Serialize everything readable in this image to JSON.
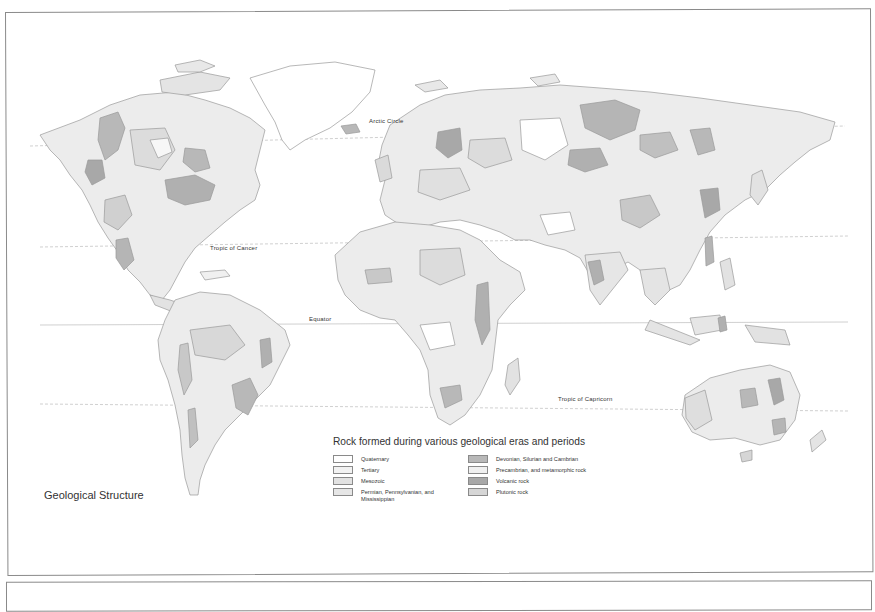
{
  "map": {
    "title": "Geological Structure",
    "reference_lines": {
      "arctic_circle": "Arctic Circle",
      "tropic_of_cancer": "Tropic of Cancer",
      "equator": "Equator",
      "tropic_of_capricorn": "Tropic of Capricorn"
    }
  },
  "legend": {
    "title": "Rock formed during various geological eras and periods",
    "left_column": [
      {
        "label": "Quaternary",
        "color": "#ffffff"
      },
      {
        "label": "Tertiary",
        "color": "#f2f2f2"
      },
      {
        "label": "Mesozoic",
        "color": "#e2e2e2"
      },
      {
        "label": "Permian, Pennsylvanian, and Mississippian",
        "color": "#e6e6e6"
      }
    ],
    "right_column": [
      {
        "label": "Devonian, Silurian and Cambrian",
        "color": "#b8b8b8"
      },
      {
        "label": "Precambrian, and metamorphic rock",
        "color": "#f0f0f0"
      },
      {
        "label": "Volcanic rock",
        "color": "#a8a8a8"
      },
      {
        "label": "Plutonic rock",
        "color": "#d6d6d6"
      }
    ]
  },
  "colors": {
    "frame": "#8a8a8a",
    "coast": "#9a9a9a",
    "land_light": "#f0f0f0",
    "land_mid": "#e0e0e0",
    "land_dark": "#b5b5b5",
    "land_darker": "#a3a3a3"
  }
}
